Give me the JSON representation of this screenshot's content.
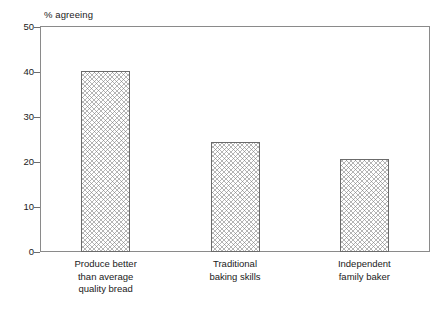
{
  "chart_data": {
    "type": "bar",
    "title": "",
    "subtitle": "",
    "ylabel": "% agreeing",
    "xlabel": "",
    "ylim": [
      0,
      50
    ],
    "yticks": [
      0,
      10,
      20,
      30,
      40,
      50
    ],
    "ytick_labels": [
      "0",
      "10",
      "20",
      "30",
      "40",
      "50"
    ],
    "grid": false,
    "legend": "none",
    "bar_fill": "crosshatch",
    "bar_edge_color": "#6b6b6b",
    "frame_color": "#8a8a8a",
    "categories": [
      "Produce better\nthan average\nquality bread",
      "Traditional\nbaking skills",
      "Independent\nfamily baker"
    ],
    "values": [
      40.2,
      24.5,
      20.6
    ],
    "series": [
      {
        "name": "% agreeing",
        "values": [
          40.2,
          24.5,
          20.6
        ]
      }
    ]
  }
}
